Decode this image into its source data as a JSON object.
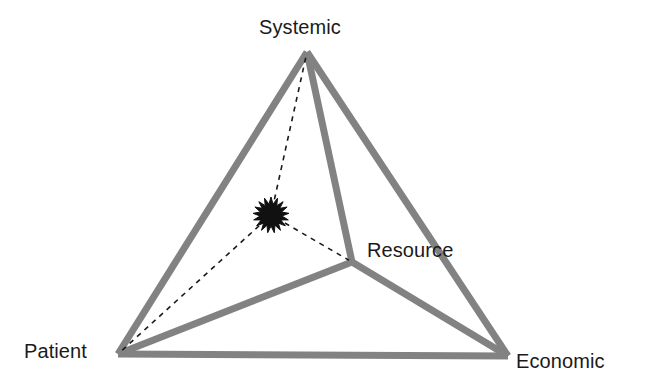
{
  "figure": {
    "background_color": "#ffffff",
    "width": 649,
    "height": 391
  },
  "style": {
    "edge_color": "#828282",
    "edge_color_light": "#8d8d8d",
    "edge_width": 7,
    "dashed_line_color": "#1a1a1a",
    "dashed_line_width": 1.6,
    "dash_pattern": "5 5",
    "marker_color": "#111111",
    "label_color": "#1a1a1a",
    "label_font_size": 20
  },
  "vertices": [
    {
      "id": "systemic",
      "label": "Systemic",
      "x": 307,
      "y": 52,
      "label_x": 259,
      "label_y": 16,
      "kind": "apex"
    },
    {
      "id": "patient",
      "label": "Patient",
      "x": 118,
      "y": 354,
      "label_x": 24,
      "label_y": 340,
      "kind": "base-left"
    },
    {
      "id": "economic",
      "label": "Economic",
      "x": 508,
      "y": 356,
      "label_x": 516,
      "label_y": 350,
      "kind": "base-right"
    },
    {
      "id": "resource",
      "label": "Resource",
      "x": 352,
      "y": 262,
      "label_x": 367,
      "label_y": 239,
      "kind": "interior"
    }
  ],
  "edges": [
    {
      "id": "systemic-patient",
      "from": "systemic",
      "to": "patient",
      "style": "solid"
    },
    {
      "id": "systemic-economic",
      "from": "systemic",
      "to": "economic",
      "style": "solid"
    },
    {
      "id": "patient-economic",
      "from": "patient",
      "to": "economic",
      "style": "solid"
    },
    {
      "id": "systemic-resource",
      "from": "systemic",
      "to": "resource",
      "style": "solid"
    },
    {
      "id": "patient-resource",
      "from": "patient",
      "to": "resource",
      "style": "solid"
    },
    {
      "id": "economic-resource",
      "from": "economic",
      "to": "resource",
      "style": "solid"
    }
  ],
  "marker": {
    "id": "interior-point",
    "shape": "starburst",
    "x": 271,
    "y": 215,
    "outer_radius": 18,
    "inner_radius": 11,
    "points": 17
  },
  "connectors": [
    {
      "id": "marker-to-systemic",
      "from": "interior-point",
      "to": "systemic",
      "style": "dashed"
    },
    {
      "id": "marker-to-patient",
      "from": "interior-point",
      "to": "patient",
      "style": "dashed"
    },
    {
      "id": "marker-to-resource",
      "from": "interior-point",
      "to": "resource",
      "style": "dashed"
    }
  ],
  "chart_data": {
    "type": "diagram",
    "subtype": "tetrahedron",
    "title": "",
    "nodes": [
      "Systemic",
      "Patient",
      "Economic",
      "Resource"
    ],
    "node_positions": {
      "Systemic": [
        307,
        52
      ],
      "Patient": [
        118,
        354
      ],
      "Economic": [
        508,
        356
      ],
      "Resource": [
        352,
        262
      ]
    },
    "solid_links": [
      [
        "Systemic",
        "Patient"
      ],
      [
        "Systemic",
        "Economic"
      ],
      [
        "Patient",
        "Economic"
      ],
      [
        "Systemic",
        "Resource"
      ],
      [
        "Patient",
        "Resource"
      ],
      [
        "Economic",
        "Resource"
      ]
    ],
    "dashed_links": [
      [
        "Point",
        "Systemic"
      ],
      [
        "Point",
        "Patient"
      ],
      [
        "Point",
        "Resource"
      ]
    ],
    "point_position": [
      271,
      215
    ],
    "legend": [],
    "grid": false
  }
}
